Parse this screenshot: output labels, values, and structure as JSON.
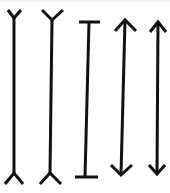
{
  "diagram": {
    "type": "muller-lyer-illusion",
    "background": "#ffffff",
    "stroke_color": "#111111",
    "figures": [
      {
        "id": "fins-out-1",
        "kind": "forked-ends",
        "top": [
          14,
          18
        ],
        "bottom": [
          14,
          173
        ]
      },
      {
        "id": "fins-out-2",
        "kind": "forked-ends",
        "top": [
          52,
          20
        ],
        "bottom": [
          50,
          173
        ]
      },
      {
        "id": "i-beam",
        "kind": "bar-ends",
        "top": [
          89,
          22
        ],
        "bottom": [
          85,
          177
        ]
      },
      {
        "id": "arrow-1",
        "kind": "arrowheads",
        "top": [
          125,
          20
        ],
        "bottom": [
          121,
          175
        ]
      },
      {
        "id": "arrow-2",
        "kind": "arrowheads",
        "top": [
          158,
          22
        ],
        "bottom": [
          157,
          174
        ]
      }
    ]
  }
}
